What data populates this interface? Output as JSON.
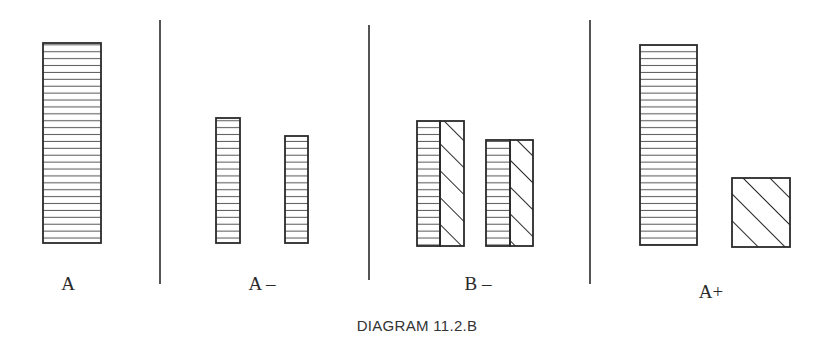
{
  "caption": "DIAGRAM 11.2.B",
  "colors": {
    "stroke": "#2a2a2a",
    "hatch": "#555555",
    "background": "#ffffff"
  },
  "panels": [
    {
      "label": "A",
      "bars": [
        {
          "x": 43,
          "y": 43,
          "w": 58,
          "h": 200,
          "fill": "horizontal"
        }
      ],
      "label_pos": [
        68,
        290
      ]
    },
    {
      "label": "A –",
      "bars": [
        {
          "x": 216,
          "y": 118,
          "w": 24,
          "h": 125,
          "fill": "horizontal"
        },
        {
          "x": 285,
          "y": 136,
          "w": 23,
          "h": 107,
          "fill": "horizontal"
        }
      ],
      "label_pos": [
        262,
        290
      ]
    },
    {
      "label": "B –",
      "bars": [
        {
          "x": 417,
          "y": 121,
          "w": 23,
          "h": 125,
          "fill": "horizontal"
        },
        {
          "x": 440,
          "y": 121,
          "w": 24,
          "h": 125,
          "fill": "diagonal"
        },
        {
          "x": 486,
          "y": 140,
          "w": 24,
          "h": 106,
          "fill": "horizontal"
        },
        {
          "x": 510,
          "y": 140,
          "w": 23,
          "h": 106,
          "fill": "diagonal"
        }
      ],
      "label_pos": [
        478,
        290
      ]
    },
    {
      "label": "A+",
      "bars": [
        {
          "x": 640,
          "y": 45,
          "w": 57,
          "h": 200,
          "fill": "horizontal"
        },
        {
          "x": 732,
          "y": 178,
          "w": 58,
          "h": 69,
          "fill": "diagonal"
        }
      ],
      "label_pos": [
        711,
        298
      ]
    }
  ],
  "dividers": [
    {
      "x": 160,
      "y1": 20,
      "y2": 284
    },
    {
      "x": 369,
      "y1": 25,
      "y2": 280
    },
    {
      "x": 590,
      "y1": 20,
      "y2": 284
    }
  ]
}
